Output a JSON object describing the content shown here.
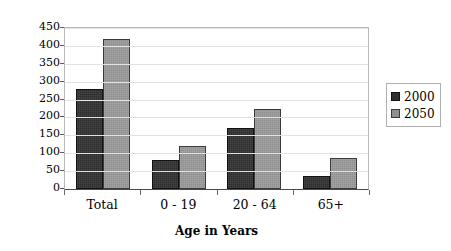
{
  "chart_data": {
    "type": "bar",
    "title": "",
    "xlabel": "Age in Years",
    "ylabel": "Millions of People",
    "categories": [
      "Total",
      "0 - 19",
      "20 - 64",
      "65+"
    ],
    "series": [
      {
        "name": "2000",
        "color": "#2e2e2e",
        "values": [
          280,
          82,
          170,
          35
        ]
      },
      {
        "name": "2050",
        "color": "#8f8f8f",
        "values": [
          420,
          120,
          225,
          88
        ]
      }
    ],
    "ylim": [
      0,
      450
    ],
    "ytick_step": 50,
    "yticks": [
      450,
      400,
      350,
      300,
      250,
      200,
      150,
      100,
      50,
      0
    ],
    "grid": true,
    "legend_position": "right"
  }
}
